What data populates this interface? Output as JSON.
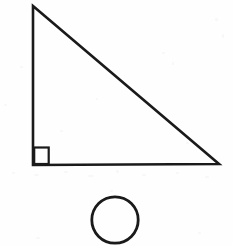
{
  "figure": {
    "background_color": "#fefefe",
    "stroke_color": "#1a1a1a",
    "canvas": {
      "width": 233,
      "height": 246
    },
    "shapes": [
      {
        "id": "right-triangle",
        "kind": "triangle",
        "label": "Right triangle",
        "stroke_width": 2.6,
        "fill": "none",
        "points": [
          {
            "x": 33,
            "y": 6
          },
          {
            "x": 219,
            "y": 164
          },
          {
            "x": 33,
            "y": 165
          }
        ],
        "vertices": {
          "apex": {
            "x": 33,
            "y": 6
          },
          "bottom_right": {
            "x": 219,
            "y": 164
          },
          "bottom_left": {
            "x": 33,
            "y": 165
          }
        }
      },
      {
        "id": "right-angle-marker",
        "kind": "square",
        "label": "Right angle marker",
        "stroke_width": 2.2,
        "fill": "none",
        "x": 34.2,
        "y": 147.5,
        "width": 14.5,
        "height": 16.5
      },
      {
        "id": "circle",
        "kind": "circle",
        "label": "Circle",
        "stroke_width": 2.8,
        "fill": "none",
        "cx": 115,
        "cy": 220,
        "r": 23.2
      }
    ],
    "specks": [
      {
        "x": 12,
        "y": 172,
        "w": 3,
        "h": 2
      },
      {
        "x": 34,
        "y": 174,
        "w": 5,
        "h": 2
      },
      {
        "x": 64,
        "y": 171,
        "w": 4,
        "h": 2
      },
      {
        "x": 88,
        "y": 175,
        "w": 6,
        "h": 2
      },
      {
        "x": 116,
        "y": 170,
        "w": 3,
        "h": 3
      },
      {
        "x": 142,
        "y": 174,
        "w": 4,
        "h": 2
      },
      {
        "x": 176,
        "y": 172,
        "w": 3,
        "h": 2
      },
      {
        "x": 205,
        "y": 176,
        "w": 4,
        "h": 2
      },
      {
        "x": 110,
        "y": 190,
        "w": 3,
        "h": 2
      },
      {
        "x": 36,
        "y": 237,
        "w": 4,
        "h": 2
      },
      {
        "x": 198,
        "y": 232,
        "w": 3,
        "h": 2
      },
      {
        "x": 215,
        "y": 18,
        "w": 3,
        "h": 3
      },
      {
        "x": 222,
        "y": 34,
        "w": 2,
        "h": 4
      },
      {
        "x": 162,
        "y": 52,
        "w": 3,
        "h": 2
      },
      {
        "x": 172,
        "y": 62,
        "w": 2,
        "h": 3
      },
      {
        "x": 20,
        "y": 66,
        "w": 3,
        "h": 2
      },
      {
        "x": 4,
        "y": 104,
        "w": 3,
        "h": 2
      },
      {
        "x": 96,
        "y": 98,
        "w": 2,
        "h": 2
      },
      {
        "x": 60,
        "y": 130,
        "w": 3,
        "h": 2
      },
      {
        "x": 186,
        "y": 142,
        "w": 3,
        "h": 2
      }
    ]
  }
}
